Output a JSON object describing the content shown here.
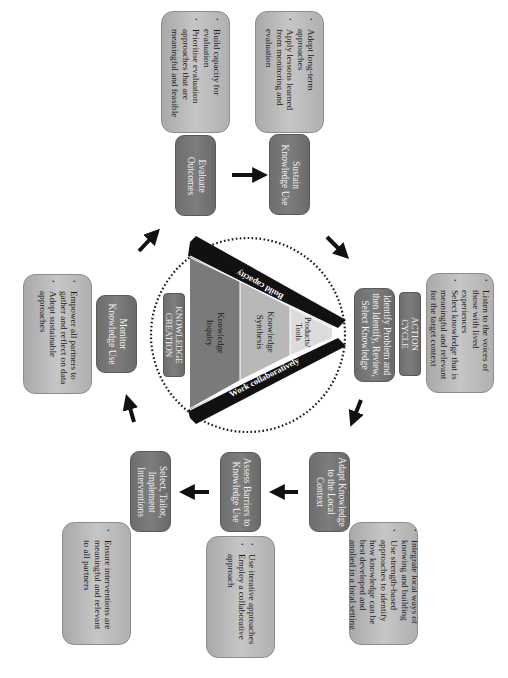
{
  "diagram": {
    "type": "knowledge-to-action cycle",
    "orientation": "rotated 90deg clockwise",
    "colors": {
      "step_box": "#737373",
      "note_box": "#bdbdbd",
      "arrow": "#111111",
      "funnel_band_dark": "#111111",
      "funnel_inquiry": "#7a7a7a",
      "funnel_synthesis": "#b8b8b8",
      "funnel_tools": "#dcdcdc",
      "dotted_circle": "#1a1a1a"
    },
    "center": {
      "title_lines": [
        "KNOWLEDGE",
        "CREATION"
      ],
      "funnel": {
        "inquiry_lines": [
          "Knowledge",
          "Inquiry"
        ],
        "synthesis_lines": [
          "Knowledge",
          "Synthesis"
        ],
        "tools_lines": [
          "Products/",
          "Tools"
        ]
      },
      "band_top": "Build capacity",
      "band_bottom": "Work collaboratively"
    },
    "action_cycle": {
      "label_lines": [
        "ACTION",
        "CYCLE"
      ]
    },
    "steps": [
      {
        "id": "identify",
        "lines": [
          "Identify Problem and",
          "then Identify, Review,",
          "Select Knowledge"
        ],
        "notes": [
          [
            "Listen to the voices of",
            "those with lived",
            "experiences"
          ],
          [
            "Select knowledge that is",
            "meaningful and relevant",
            "for the target context"
          ]
        ]
      },
      {
        "id": "adapt",
        "lines": [
          "Adapt Knowledge",
          "to the Local",
          "Context"
        ],
        "notes": [
          [
            "Integrate local ways of",
            "knowing and building"
          ],
          [
            "Use strength-based",
            "approaches to identify",
            "how knowledge can be",
            "best developed and",
            "applied in a local setting"
          ]
        ]
      },
      {
        "id": "assess",
        "lines": [
          "Assess Barriers to",
          "Knowledge Use"
        ],
        "notes": [
          [
            "Use iterative approaches"
          ],
          [
            "Employ a collaborative",
            "approach"
          ]
        ]
      },
      {
        "id": "select",
        "lines": [
          "Select, Tailor,",
          "Implement",
          "Interventions"
        ],
        "notes": [
          [
            "Ensure interventions are",
            "meaningful and relevant",
            "to all partners"
          ]
        ]
      },
      {
        "id": "monitor",
        "lines": [
          "Monitor",
          "Knowledge Use"
        ],
        "notes": [
          [
            "Empower all partners to",
            "gather and reflect on data"
          ],
          [
            "Adopt sustainable",
            "approaches"
          ]
        ]
      },
      {
        "id": "evaluate",
        "lines": [
          "Evaluate",
          "Outcomes"
        ],
        "notes": [
          [
            "Build capacity for",
            "evaluation"
          ],
          [
            "Prioritise evaluation",
            "approaches that are",
            "meaningful and feasible"
          ]
        ]
      },
      {
        "id": "sustain",
        "lines": [
          "Sustain",
          "Knowledge Use"
        ],
        "notes": [
          [
            "Adopt long-term",
            "approaches"
          ],
          [
            "Apply lessons learned",
            "from monitoring and",
            "evaluation"
          ]
        ]
      }
    ]
  }
}
